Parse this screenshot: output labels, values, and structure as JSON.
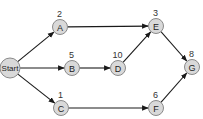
{
  "diagram": {
    "type": "network-graph",
    "nodes": [
      {
        "id": "Start",
        "label": "Start",
        "weight": "",
        "x": 10,
        "y": 68,
        "r": 10
      },
      {
        "id": "A",
        "label": "A",
        "weight": "2",
        "x": 60,
        "y": 27,
        "r": 7.5
      },
      {
        "id": "B",
        "label": "B",
        "weight": "5",
        "x": 72,
        "y": 68,
        "r": 7.5
      },
      {
        "id": "C",
        "label": "C",
        "weight": "1",
        "x": 61,
        "y": 108,
        "r": 7.5
      },
      {
        "id": "D",
        "label": "D",
        "weight": "10",
        "x": 118,
        "y": 68,
        "r": 7.5
      },
      {
        "id": "E",
        "label": "E",
        "weight": "3",
        "x": 156,
        "y": 26,
        "r": 7.5
      },
      {
        "id": "F",
        "label": "F",
        "weight": "6",
        "x": 156,
        "y": 108,
        "r": 7.5
      },
      {
        "id": "G",
        "label": "G",
        "weight": "8",
        "x": 192,
        "y": 67,
        "r": 7.5
      }
    ],
    "edges": [
      {
        "from": "Start",
        "to": "A"
      },
      {
        "from": "Start",
        "to": "B"
      },
      {
        "from": "Start",
        "to": "C"
      },
      {
        "from": "A",
        "to": "E"
      },
      {
        "from": "B",
        "to": "D"
      },
      {
        "from": "D",
        "to": "E"
      },
      {
        "from": "C",
        "to": "F"
      },
      {
        "from": "E",
        "to": "G"
      },
      {
        "from": "F",
        "to": "G"
      }
    ],
    "colors": {
      "node_fill": "#d9d9d9",
      "node_stroke": "#8a8a8a",
      "edge": "#1a1a1a",
      "text": "#222222"
    }
  }
}
